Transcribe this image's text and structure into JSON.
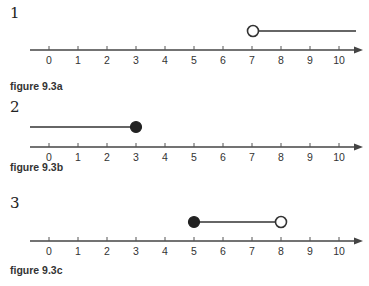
{
  "chart_data": [
    {
      "type": "number-line",
      "problem_number": "1",
      "caption": "figure 9.3a",
      "axis": {
        "min": 0,
        "max": 10,
        "ticks": [
          0,
          1,
          2,
          3,
          4,
          5,
          6,
          7,
          8,
          9,
          10
        ],
        "arrow": "right"
      },
      "graph": {
        "kind": "ray",
        "start": 7,
        "start_closed": false,
        "direction": "right",
        "inequality": "x > 7"
      }
    },
    {
      "type": "number-line",
      "problem_number": "2",
      "caption": "figure 9.3b",
      "axis": {
        "min": 0,
        "max": 10,
        "ticks": [
          0,
          1,
          2,
          3,
          4,
          5,
          6,
          7,
          8,
          9,
          10
        ],
        "arrow": "right"
      },
      "graph": {
        "kind": "ray",
        "start": 3,
        "start_closed": true,
        "direction": "left",
        "inequality": "x ≤ 3"
      }
    },
    {
      "type": "number-line",
      "problem_number": "3",
      "caption": "figure 9.3c",
      "axis": {
        "min": 0,
        "max": 10,
        "ticks": [
          0,
          1,
          2,
          3,
          4,
          5,
          6,
          7,
          8,
          9,
          10
        ],
        "arrow": "right"
      },
      "graph": {
        "kind": "segment",
        "start": 5,
        "start_closed": true,
        "end": 8,
        "end_closed": false,
        "inequality": "5 ≤ x < 8"
      }
    }
  ],
  "figures": [
    {
      "number": "1",
      "caption": "figure 9.3a"
    },
    {
      "number": "2",
      "caption": "figure 9.3b"
    },
    {
      "number": "3",
      "caption": "figure 9.3c"
    }
  ],
  "tick_labels": [
    "0",
    "1",
    "2",
    "3",
    "4",
    "5",
    "6",
    "7",
    "8",
    "9",
    "10"
  ],
  "colors": {
    "line": "#333333",
    "text": "#222222",
    "background": "#ffffff"
  }
}
